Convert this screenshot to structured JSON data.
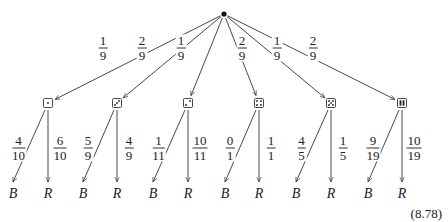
{
  "root": {
    "x": 224,
    "y": 14
  },
  "equation_number": "(8.78)",
  "branches": [
    {
      "die": 1,
      "x": 48,
      "prob": {
        "num": "1",
        "den": "9"
      },
      "label_pos": [
        103,
        48
      ],
      "leaves": [
        {
          "label": "B",
          "x": 13,
          "prob": {
            "num": "4",
            "den": "10"
          }
        },
        {
          "label": "R",
          "x": 48,
          "prob": {
            "num": "6",
            "den": "10"
          }
        }
      ]
    },
    {
      "die": 3,
      "x": 117,
      "prob": {
        "num": "2",
        "den": "9"
      },
      "label_pos": [
        142,
        48
      ],
      "leaves": [
        {
          "label": "B",
          "x": 83,
          "prob": {
            "num": "5",
            "den": "9"
          }
        },
        {
          "label": "R",
          "x": 117,
          "prob": {
            "num": "4",
            "den": "9"
          }
        }
      ]
    },
    {
      "die": 2,
      "x": 188,
      "prob": {
        "num": "1",
        "den": "9"
      },
      "label_pos": [
        181,
        48
      ],
      "leaves": [
        {
          "label": "B",
          "x": 153,
          "prob": {
            "num": "1",
            "den": "11"
          }
        },
        {
          "label": "R",
          "x": 188,
          "prob": {
            "num": "10",
            "den": "11"
          }
        }
      ]
    },
    {
      "die": 4,
      "x": 259,
      "prob": {
        "num": "2",
        "den": "9"
      },
      "label_pos": [
        242,
        48
      ],
      "leaves": [
        {
          "label": "B",
          "x": 225,
          "prob": {
            "num": "0",
            "den": "1"
          }
        },
        {
          "label": "R",
          "x": 259,
          "prob": {
            "num": "1",
            "den": "1"
          }
        }
      ]
    },
    {
      "die": 5,
      "x": 331,
      "prob": {
        "num": "1",
        "den": "9"
      },
      "label_pos": [
        277,
        48
      ],
      "leaves": [
        {
          "label": "B",
          "x": 296,
          "prob": {
            "num": "4",
            "den": "5"
          }
        },
        {
          "label": "R",
          "x": 331,
          "prob": {
            "num": "1",
            "den": "5"
          }
        }
      ]
    },
    {
      "die": 6,
      "x": 402,
      "prob": {
        "num": "2",
        "den": "9"
      },
      "label_pos": [
        313,
        48
      ],
      "leaves": [
        {
          "label": "B",
          "x": 368,
          "prob": {
            "num": "9",
            "den": "19"
          }
        },
        {
          "label": "R",
          "x": 402,
          "prob": {
            "num": "10",
            "den": "19"
          }
        }
      ]
    }
  ]
}
